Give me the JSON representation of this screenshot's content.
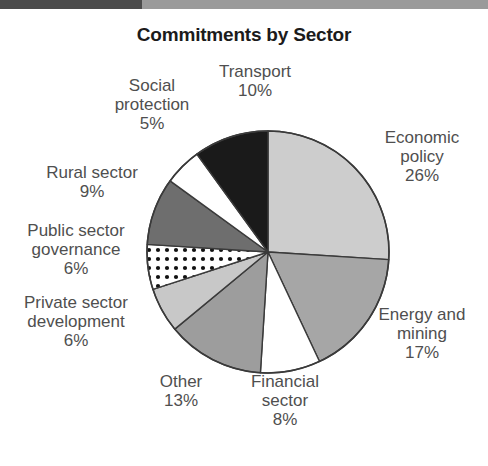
{
  "top_rule": {
    "dark_color": "#4b4b4b",
    "light_color": "#9a9a9a"
  },
  "title": "Commitments by Sector",
  "chart_data": {
    "type": "pie",
    "title": "Commitments by Sector",
    "xlabel": "",
    "ylabel": "",
    "legend_position": "none",
    "grid": false,
    "units": "percent",
    "start_angle_deg": 0,
    "direction": "clockwise",
    "categories": [
      "Economic policy",
      "Energy and mining",
      "Financial sector",
      "Other",
      "Private sector development",
      "Public sector governance",
      "Rural sector",
      "Social protection",
      "Transport"
    ],
    "values": [
      26,
      17,
      8,
      13,
      6,
      6,
      9,
      5,
      10
    ],
    "slices": [
      {
        "name": "Economic policy",
        "label_line1": "Economic",
        "label_line2": "policy",
        "percent_text": "26%",
        "value": 26,
        "fill": "#cdcdcd",
        "pattern": "solid"
      },
      {
        "name": "Energy and mining",
        "label_line1": "Energy and",
        "label_line2": "mining",
        "percent_text": "17%",
        "value": 17,
        "fill": "#a6a6a6",
        "pattern": "solid"
      },
      {
        "name": "Financial sector",
        "label_line1": "Financial",
        "label_line2": "sector",
        "percent_text": "8%",
        "value": 8,
        "fill": "#ffffff",
        "pattern": "solid"
      },
      {
        "name": "Other",
        "label_line1": "Other",
        "label_line2": "",
        "percent_text": "13%",
        "value": 13,
        "fill": "#9d9d9d",
        "pattern": "solid"
      },
      {
        "name": "Private sector development",
        "label_line1": "Private sector",
        "label_line2": "development",
        "percent_text": "6%",
        "value": 6,
        "fill": "#c8c8c8",
        "pattern": "solid"
      },
      {
        "name": "Public sector governance",
        "label_line1": "Public sector",
        "label_line2": "governance",
        "percent_text": "6%",
        "value": 6,
        "fill": "#ffffff",
        "pattern": "dots"
      },
      {
        "name": "Rural sector",
        "label_line1": "Rural sector",
        "label_line2": "",
        "percent_text": "9%",
        "value": 9,
        "fill": "#6e6e6e",
        "pattern": "solid"
      },
      {
        "name": "Social protection",
        "label_line1": "Social",
        "label_line2": "protection",
        "percent_text": "5%",
        "value": 5,
        "fill": "#ffffff",
        "pattern": "solid"
      },
      {
        "name": "Transport",
        "label_line1": "Transport",
        "label_line2": "",
        "percent_text": "10%",
        "value": 10,
        "fill": "#1a1a1a",
        "pattern": "solid"
      }
    ]
  },
  "labels": {
    "economic": {
      "l1": "Economic",
      "l2": "policy",
      "pct": "26%"
    },
    "energy": {
      "l1": "Energy and",
      "l2": "mining",
      "pct": "17%"
    },
    "financial": {
      "l1": "Financial",
      "l2": "sector",
      "pct": "8%"
    },
    "other": {
      "l1": "Other",
      "l2": "",
      "pct": "13%"
    },
    "private": {
      "l1": "Private sector",
      "l2": "development",
      "pct": "6%"
    },
    "public": {
      "l1": "Public sector",
      "l2": "governance",
      "pct": "6%"
    },
    "rural": {
      "l1": "Rural sector",
      "l2": "",
      "pct": "9%"
    },
    "social": {
      "l1": "Social",
      "l2": "protection",
      "pct": "5%"
    },
    "transport": {
      "l1": "Transport",
      "l2": "",
      "pct": "10%"
    }
  }
}
